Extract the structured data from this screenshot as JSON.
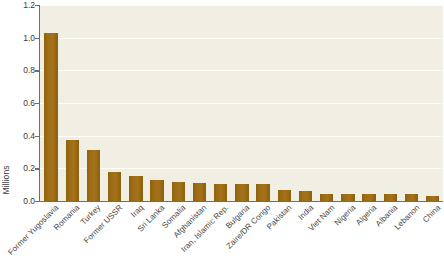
{
  "chart_data": {
    "type": "bar",
    "title": "",
    "xlabel": "",
    "ylabel": "Millions",
    "ylim": [
      0.0,
      1.2
    ],
    "ytick_labels": [
      "0.0",
      "0.2",
      "0.4",
      "0.6",
      "0.8",
      "1.0",
      "1.2"
    ],
    "ytick_values": [
      0.0,
      0.2,
      0.4,
      0.6,
      0.8,
      1.0,
      1.2
    ],
    "grid": "horizontal",
    "legend": "none",
    "bar_color": "#96660f",
    "plot_background": "#f1efe4",
    "axis_color": "#6e6e6e",
    "gridline_color": "#fdfcf6",
    "categories": [
      "Former Yugoslavia",
      "Romania",
      "Turkey",
      "Former USSR",
      "Iraq",
      "Sri Lanka",
      "Somalia",
      "Afghanistan",
      "Iran, Islamic Rep.",
      "Bulgaria",
      "Zaire/DR Congo",
      "Pakistan",
      "India",
      "Viet Nam",
      "Nigeria",
      "Algeria",
      "Albania",
      "Lebanon",
      "China"
    ],
    "values": [
      1.03,
      0.375,
      0.315,
      0.18,
      0.155,
      0.13,
      0.115,
      0.11,
      0.105,
      0.105,
      0.105,
      0.065,
      0.06,
      0.045,
      0.045,
      0.045,
      0.04,
      0.04,
      0.03
    ]
  }
}
